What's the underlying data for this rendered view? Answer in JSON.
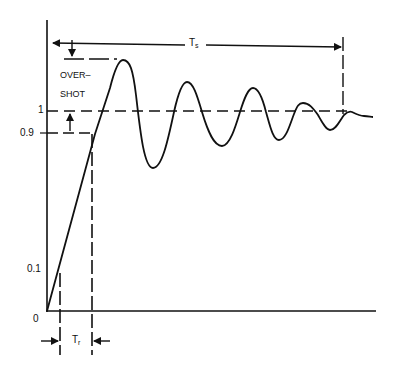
{
  "diagram": {
    "type": "step-response",
    "colors": {
      "line": "#111111",
      "background": "#ffffff"
    },
    "y_ticks": [
      {
        "label": "0",
        "value": 0
      },
      {
        "label": "0.1",
        "value": 0.1
      },
      {
        "label": "0.9",
        "value": 0.9
      },
      {
        "label": "1",
        "value": 1
      }
    ],
    "annotations": {
      "overshoot_line1": "OVER–",
      "overshoot_line2": "SHOT",
      "settling_time_main": "T",
      "settling_time_sub": "s",
      "rise_time_main": "T",
      "rise_time_sub": "r"
    }
  }
}
